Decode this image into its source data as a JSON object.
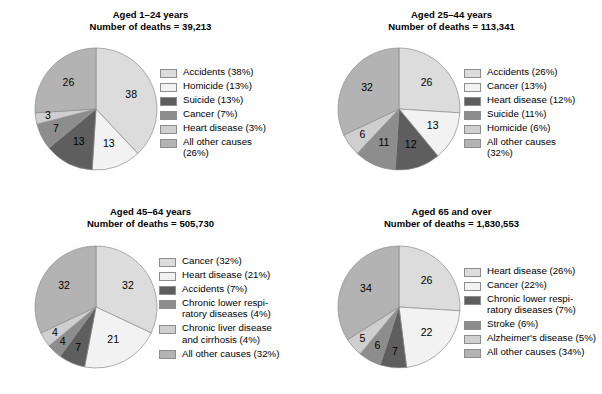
{
  "palette": {
    "light1": "#dcdcdc",
    "lightest": "#f2f2f2",
    "dark": "#5e5e5e",
    "medium_dark": "#8d8d8d",
    "light2": "#cfcfcf",
    "medium": "#b3b3b3",
    "outline": "#8d8d8d"
  },
  "chart_data": [
    {
      "type": "pie",
      "title": "Aged 1–24 years",
      "subtitle": "Number of deaths = 39,213",
      "labels": [
        "Accidents",
        "Homicide",
        "Suicide",
        "Cancer",
        "Heart disease",
        "All other causes"
      ],
      "values": [
        38,
        13,
        13,
        7,
        3,
        26
      ],
      "slice_labels": [
        "38",
        "13",
        "13",
        "7",
        "3",
        "26"
      ],
      "legend": [
        "Accidents (38%)",
        "Homicide (13%)",
        "Suicide (13%)",
        "Cancer (7%)",
        "Heart disease (3%)",
        "All other causes\n(26%)"
      ],
      "colors": [
        "#dcdcdc",
        "#f2f2f2",
        "#5e5e5e",
        "#8d8d8d",
        "#cfcfcf",
        "#b3b3b3"
      ],
      "legend_position": "right",
      "start_angle_deg": 0,
      "direction": "clockwise"
    },
    {
      "type": "pie",
      "title": "Aged 25–44 years",
      "subtitle": "Number of deaths = 113,341",
      "labels": [
        "Accidents",
        "Cancer",
        "Heart disease",
        "Suicide",
        "Homicide",
        "All other causes"
      ],
      "values": [
        26,
        13,
        12,
        11,
        6,
        32
      ],
      "slice_labels": [
        "26",
        "13",
        "12",
        "11",
        "6",
        "32"
      ],
      "legend": [
        "Accidents (26%)",
        "Cancer (13%)",
        "Heart disease (12%)",
        "Suicide (11%)",
        "Homicide (6%)",
        "All other causes\n(32%)"
      ],
      "colors": [
        "#dcdcdc",
        "#f2f2f2",
        "#5e5e5e",
        "#8d8d8d",
        "#cfcfcf",
        "#b3b3b3"
      ],
      "legend_position": "right",
      "start_angle_deg": 0,
      "direction": "clockwise"
    },
    {
      "type": "pie",
      "title": "Aged 45–64 years",
      "subtitle": "Number of deaths = 505,730",
      "labels": [
        "Cancer",
        "Heart disease",
        "Accidents",
        "Chronic lower respiratory diseases",
        "Chronic liver disease and cirrhosis",
        "All other causes"
      ],
      "values": [
        32,
        21,
        7,
        4,
        4,
        32
      ],
      "slice_labels": [
        "32",
        "21",
        "7",
        "4",
        "4",
        "32"
      ],
      "legend": [
        "Cancer (32%)",
        "Heart disease (21%)",
        "Accidents (7%)",
        "Chronic lower respi-\nratory diseases (4%)",
        "Chronic liver disease\nand cirrhosis (4%)",
        "All other causes (32%)"
      ],
      "colors": [
        "#dcdcdc",
        "#f2f2f2",
        "#5e5e5e",
        "#8d8d8d",
        "#cfcfcf",
        "#b3b3b3"
      ],
      "legend_position": "right",
      "start_angle_deg": 0,
      "direction": "clockwise"
    },
    {
      "type": "pie",
      "title": "Aged 65 and over",
      "subtitle": "Number of deaths = 1,830,553",
      "labels": [
        "Heart disease",
        "Cancer",
        "Chronic lower respiratory diseases",
        "Stroke",
        "Alzheimer's disease",
        "All other causes"
      ],
      "values": [
        26,
        22,
        7,
        6,
        5,
        34
      ],
      "slice_labels": [
        "26",
        "22",
        "7",
        "6",
        "5",
        "34"
      ],
      "legend": [
        "Heart disease (26%)",
        "Cancer (22%)",
        "Chronic lower respi-\nratory diseases (7%)",
        "Stroke (6%)",
        "Alzheimer's disease (5%)",
        "All other causes (34%)"
      ],
      "colors": [
        "#dcdcdc",
        "#f2f2f2",
        "#5e5e5e",
        "#8d8d8d",
        "#cfcfcf",
        "#b3b3b3"
      ],
      "legend_position": "right",
      "start_angle_deg": 0,
      "direction": "clockwise"
    }
  ]
}
